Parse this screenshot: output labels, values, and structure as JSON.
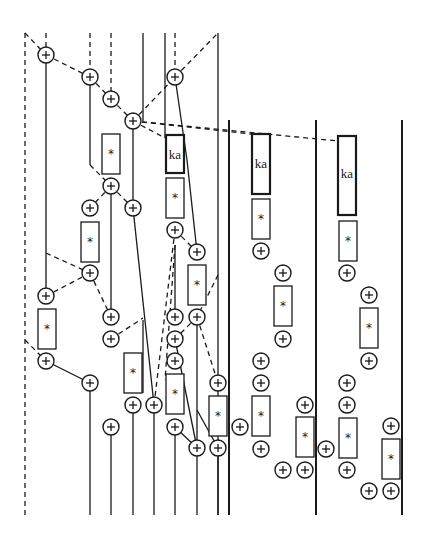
{
  "diagram": {
    "title": "",
    "labels": {
      "adder_symbol": "+",
      "multiplier_symbol": "*",
      "ka_label": "ka"
    },
    "colors": {
      "stroke": "#1a1a1a",
      "background": "#ffffff"
    },
    "node_counts": {
      "adders": 47,
      "multipliers": 14,
      "ka_blocks": 3
    }
  }
}
